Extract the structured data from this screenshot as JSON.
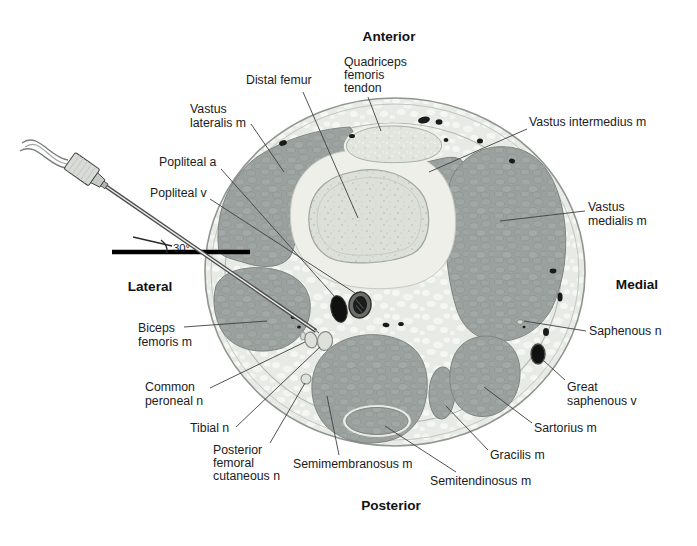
{
  "figure": {
    "orientation": {
      "anterior": "Anterior",
      "posterior": "Posterior",
      "lateral": "Lateral",
      "medial": "Medial"
    },
    "needle": {
      "angle_label": "30°"
    },
    "labels": {
      "distal_femur": {
        "text": "Distal femur"
      },
      "quadriceps_femoris_tendon": {
        "lines": [
          "Quadriceps",
          "femoris",
          "tendon"
        ]
      },
      "vastus_lateralis": {
        "lines": [
          "Vastus",
          "lateralis m"
        ]
      },
      "vastus_intermedius": {
        "text": "Vastus intermedius m"
      },
      "vastus_medialis": {
        "lines": [
          "Vastus",
          "medialis m"
        ]
      },
      "popliteal_a": {
        "text": "Popliteal a"
      },
      "popliteal_v": {
        "text": "Popliteal v"
      },
      "saphenous_n": {
        "text": "Saphenous n"
      },
      "great_saphenous_v": {
        "lines": [
          "Great",
          "saphenous v"
        ]
      },
      "sartorius": {
        "text": "Sartorius m"
      },
      "gracilis": {
        "text": "Gracilis m"
      },
      "semitendinosus": {
        "text": "Semitendinosus m"
      },
      "semimembranosus": {
        "text": "Semimembranosus m"
      },
      "posterior_femoral_cutaneous_n": {
        "lines": [
          "Posterior",
          "femoral",
          "cutaneous n"
        ]
      },
      "tibial_n": {
        "text": "Tibial n"
      },
      "common_peroneal_n": {
        "lines": [
          "Common",
          "peroneal n"
        ]
      },
      "biceps_femoris": {
        "lines": [
          "Biceps",
          "femoris m"
        ]
      }
    },
    "palette": {
      "background": "#ffffff",
      "muscle": "#9ba19e",
      "fat": "#e8eae5",
      "bone": "#dce0d9",
      "vessel_dark": "#141414",
      "nerve_fill": "#dee1d9",
      "reference_line": "#000000"
    }
  }
}
